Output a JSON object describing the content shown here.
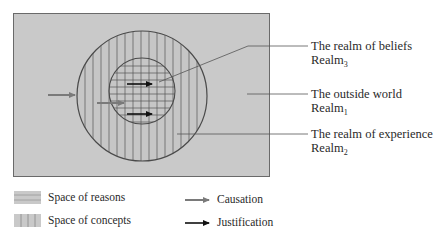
{
  "diagram": {
    "colors": {
      "background_panel": "#c9c9c9",
      "frame_border": "#6a6a6a",
      "circle_stroke": "#4a4a4a",
      "hatch": "#555555",
      "causation_arrow": "#7a7a7a",
      "justification_arrow": "#111111"
    },
    "regions": [
      {
        "id": "outer-world",
        "title": "The outside world",
        "realm_base": "Realm",
        "realm_sub": "1"
      },
      {
        "id": "experience",
        "title": "The realm of experience",
        "realm_base": "Realm",
        "realm_sub": "2"
      },
      {
        "id": "beliefs",
        "title": "The realm of beliefs",
        "realm_base": "Realm",
        "realm_sub": "3"
      }
    ]
  },
  "labels": {
    "beliefs": {
      "title": "The realm of beliefs",
      "realm": "Realm",
      "sub": "3"
    },
    "outside": {
      "title": "The outside world",
      "realm": "Realm",
      "sub": "1"
    },
    "experience": {
      "title": "The realm of experience",
      "realm": "Realm",
      "sub": "2"
    }
  },
  "legend": {
    "reasons": "Space of reasons",
    "concepts": "Space of concepts",
    "causation": "Causation",
    "justification": "Justification"
  }
}
